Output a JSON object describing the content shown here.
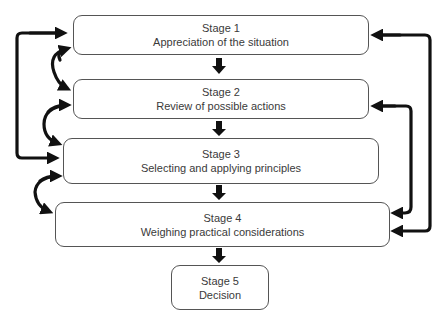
{
  "diagram": {
    "type": "flowchart",
    "stages": [
      {
        "title": "Stage 1",
        "label": "Appreciation of the situation"
      },
      {
        "title": "Stage 2",
        "label": "Review of possible actions"
      },
      {
        "title": "Stage 3",
        "label": "Selecting and applying principles"
      },
      {
        "title": "Stage 4",
        "label": "Weighing practical considerations"
      },
      {
        "title": "Stage 5",
        "label": "Decision"
      }
    ],
    "edges": [
      {
        "from": "Stage 1",
        "to": "Stage 2",
        "style": "down-arrow"
      },
      {
        "from": "Stage 2",
        "to": "Stage 3",
        "style": "down-arrow"
      },
      {
        "from": "Stage 3",
        "to": "Stage 4",
        "style": "down-arrow"
      },
      {
        "from": "Stage 4",
        "to": "Stage 5",
        "style": "down-arrow"
      },
      {
        "between": [
          "Stage 1",
          "Stage 2"
        ],
        "style": "curved-bidirectional-left"
      },
      {
        "between": [
          "Stage 2",
          "Stage 3"
        ],
        "style": "curved-bidirectional-left"
      },
      {
        "between": [
          "Stage 3",
          "Stage 4"
        ],
        "style": "curved-bidirectional-left"
      },
      {
        "between": [
          "Stage 1",
          "Stage 3"
        ],
        "style": "loop-bidirectional-left"
      },
      {
        "between": [
          "Stage 1",
          "Stage 4"
        ],
        "style": "loop-bidirectional-right-outer"
      },
      {
        "between": [
          "Stage 2",
          "Stage 4"
        ],
        "style": "loop-bidirectional-right-inner"
      }
    ]
  }
}
